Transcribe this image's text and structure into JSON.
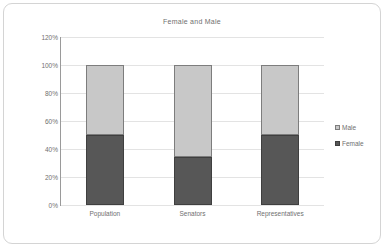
{
  "chart_data": {
    "type": "bar",
    "subtype": "stacked-column-100",
    "title": "Female and Male",
    "xlabel": "",
    "ylabel": "",
    "categories": [
      "Population",
      "Senators",
      "Representatives"
    ],
    "series": [
      {
        "name": "Female",
        "values": [
          50,
          34,
          50
        ],
        "color": "#575757"
      },
      {
        "name": "Male",
        "values": [
          50,
          66,
          50
        ],
        "color": "#c8c8c8"
      }
    ],
    "ylim": [
      0,
      120
    ],
    "yticks": [
      0,
      20,
      40,
      60,
      80,
      100,
      120
    ],
    "ytick_labels": [
      "0%",
      "20%",
      "40%",
      "60%",
      "80%",
      "100%",
      "120%"
    ],
    "grid": true,
    "grid_axis": "y",
    "legend_position": "right",
    "legend_order": [
      "Male",
      "Female"
    ],
    "stack_order_bottom_to_top": [
      "Female",
      "Male"
    ]
  },
  "legend": {
    "entries": [
      {
        "label": "Male"
      },
      {
        "label": "Female"
      }
    ]
  },
  "colors": {
    "female": "#575757",
    "male": "#c8c8c8",
    "gridline": "#e3e3e3",
    "axis": "#9a9a9a",
    "text": "#6f6f6f",
    "frame": "#d4d4d4"
  }
}
